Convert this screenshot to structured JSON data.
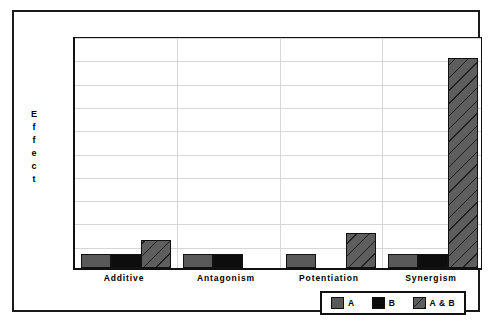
{
  "chart_data": {
    "type": "bar",
    "title": "",
    "xlabel": "",
    "ylabel": "Effect",
    "ylim": [
      0,
      100
    ],
    "yticks": [
      0,
      10,
      20,
      30,
      40,
      50,
      60,
      70,
      80,
      90,
      100
    ],
    "grid": true,
    "legend_position": "bottom-right",
    "categories": [
      "Additive",
      "Antagonism",
      "Potentiation",
      "Synergism"
    ],
    "series": [
      {
        "name": "A",
        "values": [
          6,
          6,
          6,
          6
        ]
      },
      {
        "name": "B",
        "values": [
          6,
          6,
          0,
          6
        ]
      },
      {
        "name": "A & B",
        "values": [
          12,
          0,
          15,
          90
        ]
      }
    ],
    "colors": {
      "A": "#595959",
      "B": "#0d0d0d",
      "A & B": "#5e5e5e",
      "grid": "#d6d6d6",
      "axis": "#111111",
      "frame": "#1a1a1a",
      "background": "#ffffff"
    }
  },
  "axis": {
    "y_title_letters": [
      "E",
      "f",
      "f",
      "e",
      "c",
      "t"
    ]
  },
  "legend": {
    "entries": [
      {
        "label": "A",
        "swatch": "series-a"
      },
      {
        "label": "B",
        "swatch": "series-b"
      },
      {
        "label": "A & B",
        "swatch": "series-ab"
      }
    ]
  }
}
